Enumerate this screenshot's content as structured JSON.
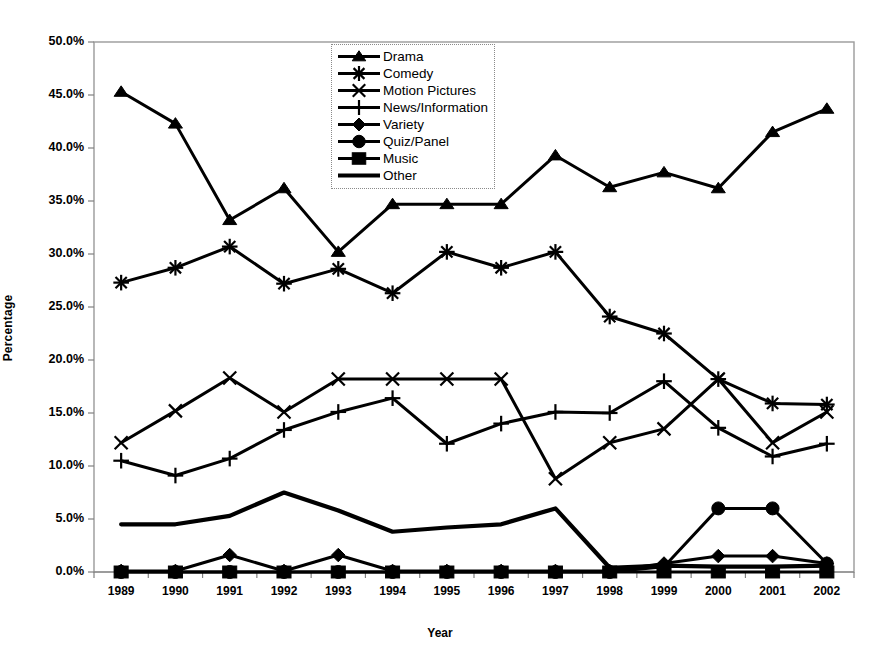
{
  "chart_data": {
    "type": "line",
    "title": "",
    "subtitle": "",
    "xlabel": "Year",
    "ylabel": "Percentage",
    "grid": false,
    "legend_position": "top-center-inside",
    "x": [
      "1989",
      "1990",
      "1991",
      "1992",
      "1993",
      "1994",
      "1995",
      "1996",
      "1997",
      "1998",
      "1999",
      "2000",
      "2001",
      "2002"
    ],
    "categories": [
      "1989",
      "1990",
      "1991",
      "1992",
      "1993",
      "1994",
      "1995",
      "1996",
      "1997",
      "1998",
      "1999",
      "2000",
      "2001",
      "2002"
    ],
    "ylim": [
      0,
      50
    ],
    "ytick_labels": [
      "50.0%",
      "45.0%",
      "40.0%",
      "35.0%",
      "30.0%",
      "25.0%",
      "20.0%",
      "15.0%",
      "10.0%",
      "5.0%",
      "0.0%"
    ],
    "ytick_values": [
      50,
      45,
      40,
      35,
      30,
      25,
      20,
      15,
      10,
      5,
      0
    ],
    "y_unit": "%",
    "series": [
      {
        "name": "Drama",
        "marker": "triangle",
        "values": [
          45.3,
          42.3,
          33.2,
          36.2,
          30.2,
          34.7,
          34.7,
          34.7,
          39.3,
          36.3,
          37.7,
          36.2,
          41.5,
          43.7
        ]
      },
      {
        "name": "Comedy",
        "marker": "asterisk",
        "values": [
          27.3,
          28.7,
          30.7,
          27.2,
          28.6,
          26.3,
          30.2,
          28.7,
          30.2,
          24.1,
          22.5,
          18.2,
          15.9,
          15.8
        ]
      },
      {
        "name": "Motion Pictures",
        "marker": "cross",
        "values": [
          12.2,
          15.2,
          18.3,
          15.1,
          18.2,
          18.2,
          18.2,
          18.2,
          8.8,
          12.2,
          13.5,
          18.2,
          12.2,
          15.1
        ]
      },
      {
        "name": "News/Information",
        "marker": "plus",
        "values": [
          10.5,
          9.1,
          10.7,
          13.4,
          15.1,
          16.4,
          12.1,
          14.0,
          15.1,
          15.0,
          18.0,
          13.6,
          10.9,
          12.1
        ]
      },
      {
        "name": "Variety",
        "marker": "diamond",
        "values": [
          0.1,
          0.1,
          1.6,
          0.1,
          1.6,
          0.1,
          0.1,
          0.1,
          0.1,
          0.1,
          0.8,
          1.5,
          1.5,
          0.8
        ]
      },
      {
        "name": "Quiz/Panel",
        "marker": "circle",
        "values": [
          0.0,
          0.0,
          0.0,
          0.0,
          0.0,
          0.0,
          0.0,
          0.0,
          0.0,
          0.0,
          0.5,
          6.0,
          6.0,
          0.8
        ]
      },
      {
        "name": "Music",
        "marker": "square",
        "values": [
          0.0,
          0.0,
          0.0,
          0.0,
          0.0,
          0.0,
          0.0,
          0.0,
          0.0,
          0.0,
          0.0,
          0.0,
          0.0,
          0.0
        ]
      },
      {
        "name": "Other",
        "marker": "none",
        "values": [
          4.5,
          4.5,
          5.3,
          7.5,
          5.8,
          3.8,
          4.2,
          4.5,
          6.0,
          0.4,
          0.6,
          0.5,
          0.5,
          0.6
        ]
      }
    ],
    "colors": {
      "series_color": "#000000",
      "axis_color": "#808080",
      "plot_border": "#9a9a9a",
      "background": "#ffffff"
    }
  },
  "axis": {
    "ylabel": "Percentage",
    "xlabel": "Year"
  },
  "legend": {
    "items": [
      {
        "label": "Drama",
        "marker": "triangle"
      },
      {
        "label": "Comedy",
        "marker": "asterisk"
      },
      {
        "label": "Motion Pictures",
        "marker": "cross"
      },
      {
        "label": "News/Information",
        "marker": "plus"
      },
      {
        "label": "Variety",
        "marker": "diamond"
      },
      {
        "label": "Quiz/Panel",
        "marker": "circle"
      },
      {
        "label": "Music",
        "marker": "square"
      },
      {
        "label": "Other",
        "marker": "none"
      }
    ]
  }
}
